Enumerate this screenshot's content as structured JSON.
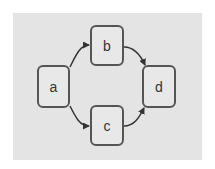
{
  "diagram": {
    "type": "directed-graph",
    "colors": {
      "panel_background": "#e4e4e4",
      "node_fill": "#e8e8e8",
      "node_stroke": "#555555",
      "edge": "#333333",
      "label": "#333333"
    },
    "nodes": [
      {
        "id": "a",
        "label": "a",
        "x": 37,
        "y": 65,
        "w": 33,
        "h": 43
      },
      {
        "id": "b",
        "label": "b",
        "x": 90,
        "y": 25,
        "w": 34,
        "h": 41
      },
      {
        "id": "c",
        "label": "c",
        "x": 90,
        "y": 105,
        "w": 34,
        "h": 41
      },
      {
        "id": "d",
        "label": "d",
        "x": 142,
        "y": 65,
        "w": 34,
        "h": 43
      }
    ],
    "edges": [
      {
        "from": "a",
        "to": "b"
      },
      {
        "from": "a",
        "to": "c"
      },
      {
        "from": "b",
        "to": "d"
      },
      {
        "from": "c",
        "to": "d"
      }
    ]
  }
}
